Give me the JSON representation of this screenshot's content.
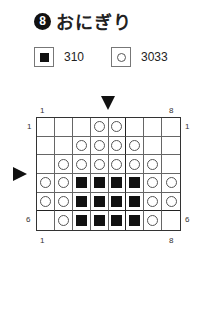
{
  "title": {
    "number": "8",
    "text": "おにぎり"
  },
  "legend": [
    {
      "symbol": "filled-square",
      "code": "310"
    },
    {
      "symbol": "open-circle",
      "code": "3033"
    }
  ],
  "grid": {
    "col_labels": {
      "start": "1",
      "end": "8"
    },
    "row_labels": {
      "start": "1",
      "end": "6"
    },
    "rows": [
      [
        "",
        "",
        "",
        "O",
        "O",
        "",
        "",
        ""
      ],
      [
        "",
        "",
        "O",
        "O",
        "O",
        "O",
        "",
        ""
      ],
      [
        "",
        "O",
        "O",
        "O",
        "O",
        "O",
        "O",
        ""
      ],
      [
        "O",
        "O",
        "X",
        "X",
        "X",
        "X",
        "O",
        "O"
      ],
      [
        "O",
        "O",
        "X",
        "X",
        "X",
        "X",
        "O",
        "O"
      ],
      [
        "",
        "O",
        "X",
        "X",
        "X",
        "X",
        "O",
        ""
      ]
    ]
  }
}
